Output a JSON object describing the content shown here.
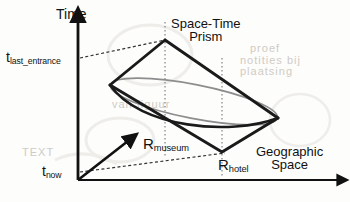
{
  "figure": {
    "type": "diagram",
    "background_color": "#fdfdfc",
    "line_color": "#111111",
    "accent_gray": "#8d8d8d"
  },
  "axes": {
    "vertical": {
      "name": "time-axis",
      "label": "Time",
      "arrow_direction": "up",
      "from": [
        78,
        180
      ],
      "to": [
        78,
        14
      ]
    },
    "horizontal": {
      "name": "geographic-space-axis",
      "label_line1": "Geographic",
      "label_line2": "Space",
      "arrow_direction": "right",
      "from": [
        78,
        180
      ],
      "to": [
        345,
        180
      ]
    }
  },
  "tick_labels": {
    "time_upper": {
      "base": "t",
      "sub": "last_entrance",
      "y": 58
    },
    "time_lower": {
      "base": "t",
      "sub": "now",
      "y": 172
    },
    "space_left": {
      "base": "R",
      "sub": "museum",
      "x": 165
    },
    "space_right": {
      "base": "R",
      "sub": "hotel",
      "x": 222
    }
  },
  "annotations": {
    "prism_label_line1": "Space-Time",
    "prism_label_line2": "Prism"
  },
  "prism": {
    "apex": [
      165,
      40
    ],
    "left_vertex": [
      110,
      85
    ],
    "right_vertex": [
      278,
      118
    ],
    "bottom_vertex": [
      222,
      152
    ],
    "description": "rhombus cone pair with elliptical base disc"
  },
  "ghost_text": {
    "items": [
      {
        "text": "proef",
        "x": 262,
        "y": 48
      },
      {
        "text": "notities bij",
        "x": 252,
        "y": 60
      },
      {
        "text": "plaatsing",
        "x": 252,
        "y": 71
      },
      {
        "text": "van figuur",
        "x": 112,
        "y": 104
      },
      {
        "text": "TEXT",
        "x": 26,
        "y": 150
      }
    ]
  }
}
